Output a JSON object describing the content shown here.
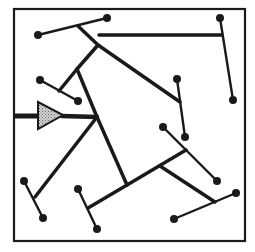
{
  "diagram": {
    "width": 255,
    "height": 252,
    "background": "#ffffff",
    "stroke_color": "#1a1a1a",
    "triangle_fill": "#b8b8b8",
    "frame": {
      "x": 14,
      "y": 9,
      "width": 231,
      "height": 232
    },
    "input_stem": {
      "x1": 14,
      "y1": 116,
      "x2": 38,
      "y2": 116,
      "width": 5
    },
    "triangle": {
      "points": "38,102 38,129 63,115"
    },
    "thick_branches": [
      {
        "x1": 62,
        "y1": 116,
        "x2": 97,
        "y2": 117,
        "w": 4.5
      },
      {
        "x1": 97,
        "y1": 117,
        "x2": 77,
        "y2": 69,
        "w": 3.5
      },
      {
        "x1": 77,
        "y1": 69,
        "x2": 98,
        "y2": 45,
        "w": 3.5
      },
      {
        "x1": 98,
        "y1": 45,
        "x2": 78,
        "y2": 26,
        "w": 3.5
      },
      {
        "x1": 98,
        "y1": 45,
        "x2": 180,
        "y2": 102,
        "w": 3.5
      },
      {
        "x1": 99,
        "y1": 35,
        "x2": 222,
        "y2": 35,
        "w": 3.5
      },
      {
        "x1": 77,
        "y1": 69,
        "x2": 59,
        "y2": 91,
        "w": 3.5
      },
      {
        "x1": 97,
        "y1": 117,
        "x2": 127,
        "y2": 185,
        "w": 3.5
      },
      {
        "x1": 97,
        "y1": 117,
        "x2": 35,
        "y2": 197,
        "w": 3.5
      },
      {
        "x1": 127,
        "y1": 185,
        "x2": 88,
        "y2": 208,
        "w": 3.5
      },
      {
        "x1": 127,
        "y1": 185,
        "x2": 186,
        "y2": 150,
        "w": 3.5
      },
      {
        "x1": 160,
        "y1": 166,
        "x2": 215,
        "y2": 202,
        "w": 3.5
      }
    ],
    "dendrites": [
      {
        "x1": 38,
        "y1": 35,
        "x2": 107,
        "y2": 18
      },
      {
        "x1": 220,
        "y1": 18,
        "x2": 233,
        "y2": 100
      },
      {
        "x1": 40,
        "y1": 80,
        "x2": 78,
        "y2": 101
      },
      {
        "x1": 177,
        "y1": 79,
        "x2": 185,
        "y2": 137
      },
      {
        "x1": 163,
        "y1": 127,
        "x2": 217,
        "y2": 181
      },
      {
        "x1": 24,
        "y1": 181,
        "x2": 43,
        "y2": 218
      },
      {
        "x1": 78,
        "y1": 189,
        "x2": 97,
        "y2": 229
      },
      {
        "x1": 174,
        "y1": 219,
        "x2": 236,
        "y2": 193
      }
    ],
    "terminals": [
      {
        "cx": 38,
        "cy": 35
      },
      {
        "cx": 107,
        "cy": 18
      },
      {
        "cx": 220,
        "cy": 18
      },
      {
        "cx": 233,
        "cy": 100
      },
      {
        "cx": 40,
        "cy": 80
      },
      {
        "cx": 78,
        "cy": 101
      },
      {
        "cx": 177,
        "cy": 79
      },
      {
        "cx": 185,
        "cy": 137
      },
      {
        "cx": 163,
        "cy": 127
      },
      {
        "cx": 217,
        "cy": 181
      },
      {
        "cx": 24,
        "cy": 181
      },
      {
        "cx": 43,
        "cy": 218
      },
      {
        "cx": 78,
        "cy": 189
      },
      {
        "cx": 97,
        "cy": 229
      },
      {
        "cx": 174,
        "cy": 219
      },
      {
        "cx": 236,
        "cy": 193
      }
    ],
    "terminal_radius": 4
  }
}
